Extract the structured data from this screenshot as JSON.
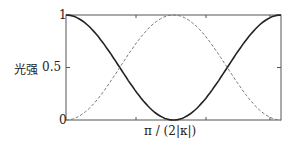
{
  "chart_data": {
    "type": "line",
    "title": "",
    "xlabel": "π/(2|κ|)",
    "ylabel": "光强",
    "ylim": [
      0,
      1
    ],
    "yticks": [
      "0",
      "0.5",
      "1"
    ],
    "x": [
      0,
      0.25,
      0.5,
      0.75,
      1,
      1.25,
      1.5,
      1.75,
      2
    ],
    "series": [
      {
        "name": "solid",
        "style": "solid",
        "values": [
          1,
          0.854,
          0.5,
          0.146,
          0,
          0.146,
          0.5,
          0.854,
          1
        ]
      },
      {
        "name": "dashed",
        "style": "dashed",
        "values": [
          0,
          0.146,
          0.5,
          0.854,
          1,
          0.854,
          0.5,
          0.146,
          0
        ]
      }
    ],
    "grid": false
  },
  "labels": {
    "ylabel": "光强",
    "xlabel": "π / (2|κ|)",
    "y0": "0",
    "y05": "0.5",
    "y1": "1"
  }
}
